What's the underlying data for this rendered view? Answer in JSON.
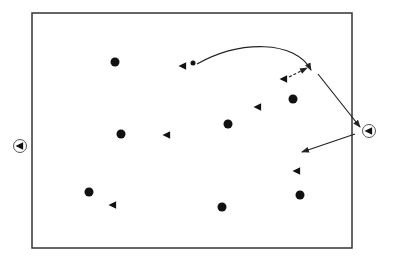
{
  "diagram": {
    "type": "drill-diagram",
    "colors": {
      "stroke": "#222222",
      "fill": "#111111",
      "background": "#ffffff"
    },
    "field": {
      "x": 32,
      "y": 13,
      "width": 320,
      "height": 235
    },
    "dots": [
      {
        "x": 115,
        "y": 62,
        "r": 4.5
      },
      {
        "x": 293,
        "y": 99,
        "r": 4.5
      },
      {
        "x": 121,
        "y": 134,
        "r": 4.5
      },
      {
        "x": 228,
        "y": 124,
        "r": 4.5
      },
      {
        "x": 89,
        "y": 192,
        "r": 4.5
      },
      {
        "x": 222,
        "y": 207,
        "r": 4.5
      },
      {
        "x": 300,
        "y": 195,
        "r": 4.5
      }
    ],
    "ball": {
      "x": 193,
      "y": 63,
      "r": 2.5
    },
    "triangles": [
      {
        "x": 183,
        "y": 66
      },
      {
        "x": 284,
        "y": 79
      },
      {
        "x": 258,
        "y": 107
      },
      {
        "x": 167,
        "y": 135
      },
      {
        "x": 297,
        "y": 171
      },
      {
        "x": 113,
        "y": 205
      }
    ],
    "circled_triangles": [
      {
        "x": 20,
        "y": 146
      },
      {
        "x": 369,
        "y": 131
      }
    ],
    "arrows": [
      {
        "kind": "curved",
        "d": "M197,64 C240,40 295,40 311,70"
      },
      {
        "kind": "dashed",
        "d": "M289,77 L307,68"
      },
      {
        "kind": "straight",
        "d": "M318,74 L360,127"
      },
      {
        "kind": "straight",
        "d": "M355,134 L302,152"
      }
    ]
  }
}
